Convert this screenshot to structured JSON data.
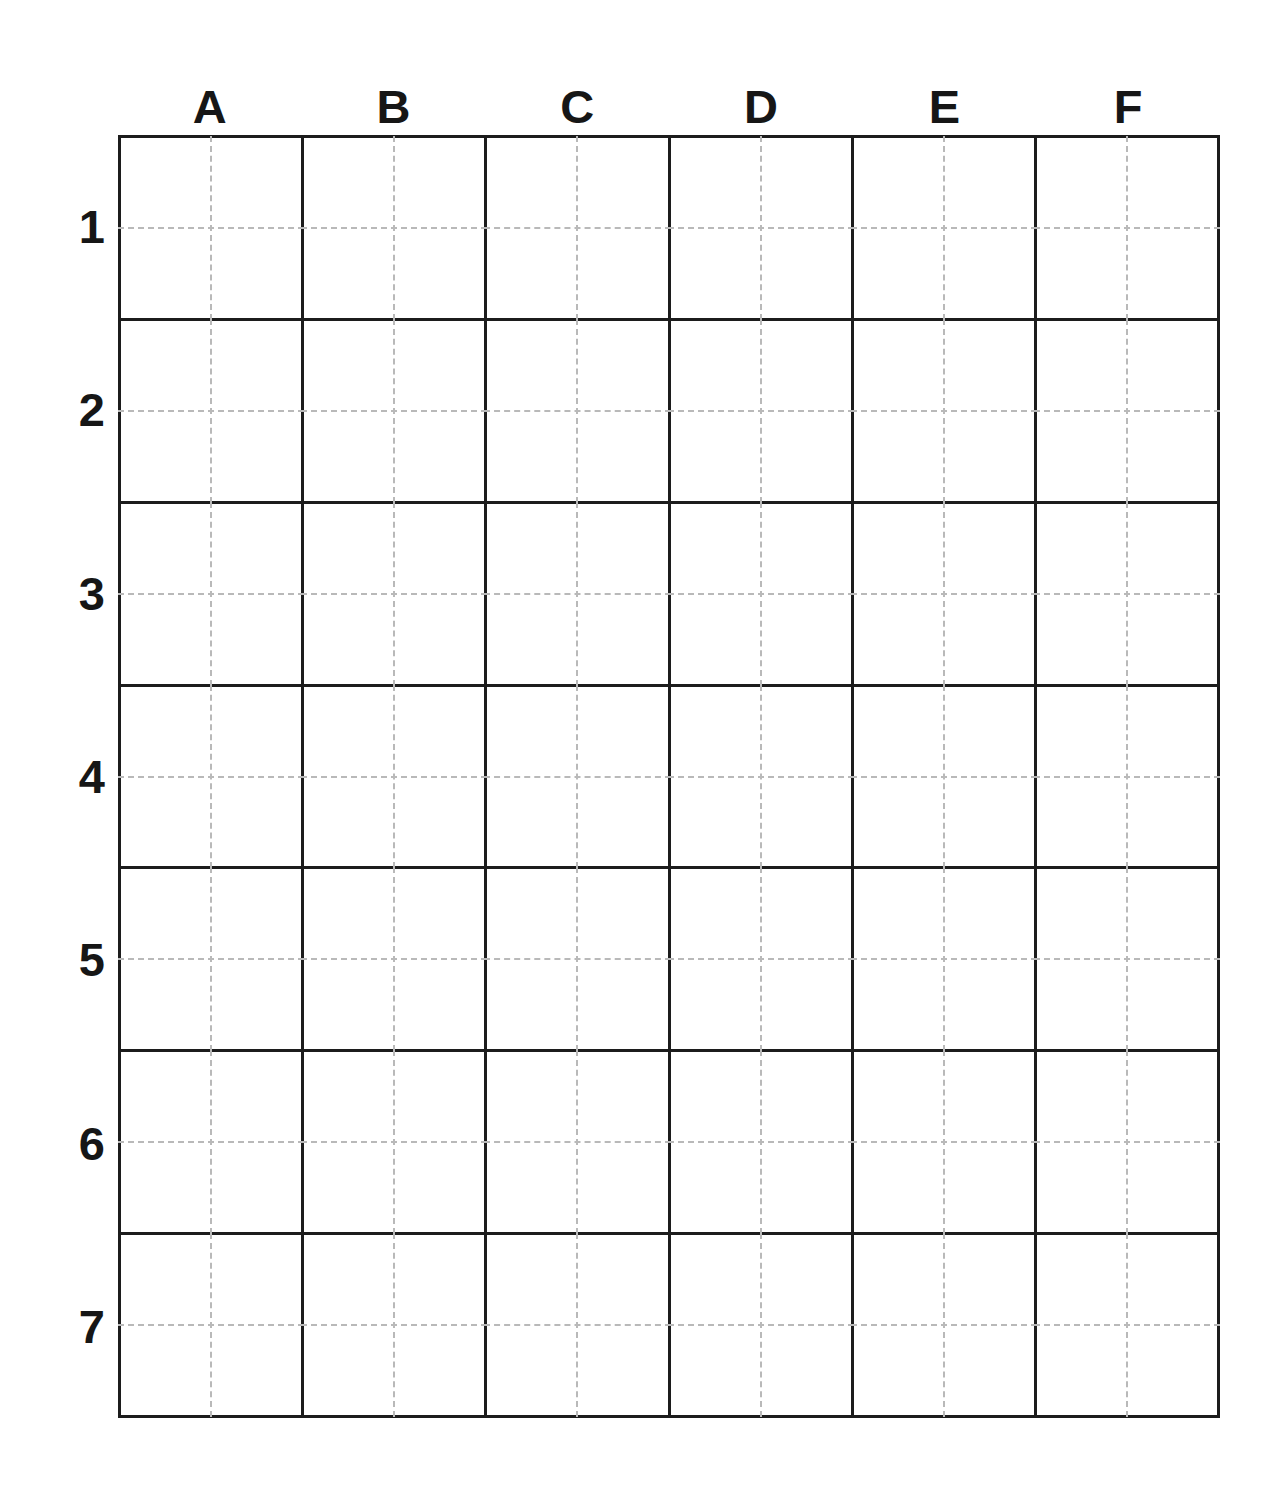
{
  "sheet": {
    "title": "Grid Worksheet",
    "background_color": "#ffffff",
    "line_color": "#1c1c1c",
    "guide_color": "#b9b9b9",
    "label_color": "#161616"
  },
  "grid": {
    "column_labels": [
      "A",
      "B",
      "C",
      "D",
      "E",
      "F"
    ],
    "row_labels": [
      "1",
      "2",
      "3",
      "4",
      "5",
      "6",
      "7"
    ],
    "columns": 6,
    "rows": 7,
    "cells": [
      [
        {
          "ref": "A1",
          "value": ""
        },
        {
          "ref": "B1",
          "value": ""
        },
        {
          "ref": "C1",
          "value": ""
        },
        {
          "ref": "D1",
          "value": ""
        },
        {
          "ref": "E1",
          "value": ""
        },
        {
          "ref": "F1",
          "value": ""
        }
      ],
      [
        {
          "ref": "A2",
          "value": ""
        },
        {
          "ref": "B2",
          "value": ""
        },
        {
          "ref": "C2",
          "value": ""
        },
        {
          "ref": "D2",
          "value": ""
        },
        {
          "ref": "E2",
          "value": ""
        },
        {
          "ref": "F2",
          "value": ""
        }
      ],
      [
        {
          "ref": "A3",
          "value": ""
        },
        {
          "ref": "B3",
          "value": ""
        },
        {
          "ref": "C3",
          "value": ""
        },
        {
          "ref": "D3",
          "value": ""
        },
        {
          "ref": "E3",
          "value": ""
        },
        {
          "ref": "F3",
          "value": ""
        }
      ],
      [
        {
          "ref": "A4",
          "value": ""
        },
        {
          "ref": "B4",
          "value": ""
        },
        {
          "ref": "C4",
          "value": ""
        },
        {
          "ref": "D4",
          "value": ""
        },
        {
          "ref": "E4",
          "value": ""
        },
        {
          "ref": "F4",
          "value": ""
        }
      ],
      [
        {
          "ref": "A5",
          "value": ""
        },
        {
          "ref": "B5",
          "value": ""
        },
        {
          "ref": "C5",
          "value": ""
        },
        {
          "ref": "D5",
          "value": ""
        },
        {
          "ref": "E5",
          "value": ""
        },
        {
          "ref": "F5",
          "value": ""
        }
      ],
      [
        {
          "ref": "A6",
          "value": ""
        },
        {
          "ref": "B6",
          "value": ""
        },
        {
          "ref": "C6",
          "value": ""
        },
        {
          "ref": "D6",
          "value": ""
        },
        {
          "ref": "E6",
          "value": ""
        },
        {
          "ref": "F6",
          "value": ""
        }
      ],
      [
        {
          "ref": "A7",
          "value": ""
        },
        {
          "ref": "B7",
          "value": ""
        },
        {
          "ref": "C7",
          "value": ""
        },
        {
          "ref": "D7",
          "value": ""
        },
        {
          "ref": "E7",
          "value": ""
        },
        {
          "ref": "F7",
          "value": ""
        }
      ]
    ]
  }
}
